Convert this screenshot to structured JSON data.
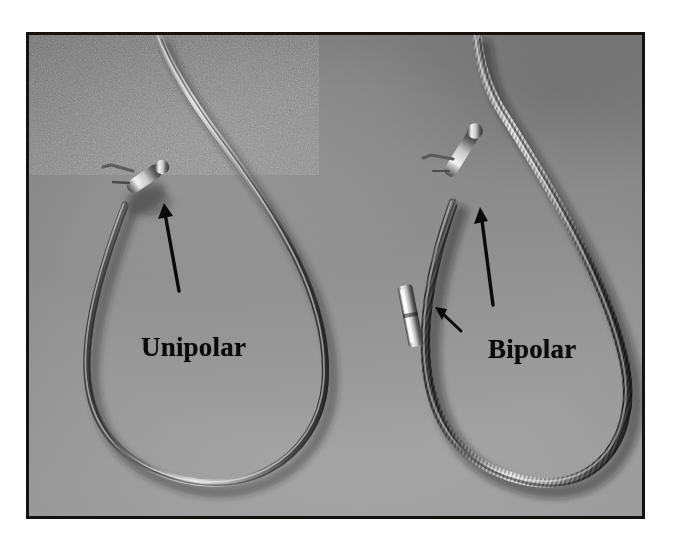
{
  "figure": {
    "type": "photograph",
    "background_color": "#8f8f8f",
    "border_color": "#14110f",
    "frame": {
      "x": 26,
      "y": 32,
      "width": 619,
      "height": 487
    }
  },
  "annotations": {
    "unipolar": {
      "label": "Unipolar",
      "color": "#0b0a09",
      "arrow": {
        "name": "arrow-unipolar",
        "direction": "up-left",
        "from_x": 176,
        "from_y": 288,
        "to_x": 161,
        "to_y": 202
      }
    },
    "bipolar": {
      "label": "Bipolar",
      "color": "#0b0a09",
      "arrow_tip": {
        "name": "arrow-bipolar-tip",
        "direction": "up",
        "from_x": 488,
        "from_y": 302,
        "to_x": 477,
        "to_y": 205
      },
      "arrow_band": {
        "name": "arrow-bipolar-band",
        "direction": "up-left",
        "from_x": 456,
        "from_y": 327,
        "to_x": 433,
        "to_y": 303
      }
    }
  },
  "objects": [
    {
      "name": "unipolar-lead",
      "label": "Unipolar",
      "surface": "smooth",
      "loop_center_x": 180,
      "loop_bottom_y": 470,
      "tip_x": 135,
      "tip_y": 185
    },
    {
      "name": "bipolar-lead",
      "label": "Bipolar",
      "surface": "coiled",
      "loop_center_x": 490,
      "loop_bottom_y": 470,
      "tip_x": 463,
      "tip_y": 180,
      "electrode_band": {
        "x": 408,
        "y": 288,
        "width": 16,
        "height": 58
      }
    }
  ]
}
